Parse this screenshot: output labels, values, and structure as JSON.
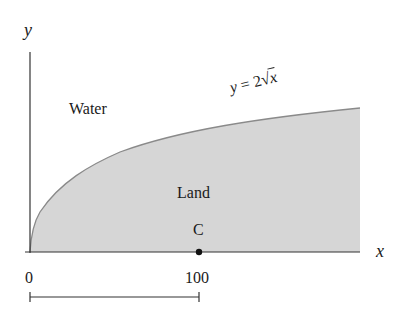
{
  "diagram": {
    "axes": {
      "x_label": "x",
      "y_label": "y"
    },
    "regions": {
      "water_label": "Water",
      "land_label": "Land"
    },
    "curve": {
      "equation_label": "y = 2√x",
      "lhs": "y",
      "eq": "=",
      "coef": "2",
      "radical": "√",
      "var": "x"
    },
    "point": {
      "label": "C",
      "x_value": 100
    },
    "ticks": [
      {
        "label": "0"
      },
      {
        "label": "100"
      }
    ],
    "scale_bar": {
      "from": 0,
      "to": 100
    },
    "colors": {
      "land_fill": "#d6d6d6",
      "curve": "#8a8a8a",
      "axis": "#333333"
    }
  }
}
